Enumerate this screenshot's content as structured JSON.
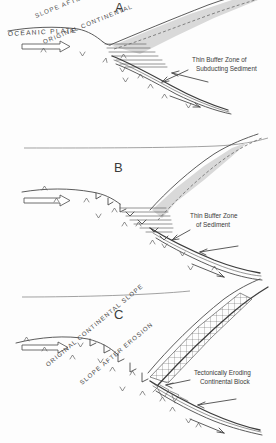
{
  "figure": {
    "style": "hand-drawn line diagram, grayscale"
  },
  "colors": {
    "ink": "#4a4a4a",
    "ink_light": "#6a6a6a",
    "wedge_fill": "#d9d9d9",
    "background": "#ffffff",
    "water_line": "#8a8a8a"
  },
  "panels": [
    {
      "id": "a",
      "letter": "A",
      "labels": {
        "oceanic_plate": "OCEANIC PLATE",
        "slope_after": "SLOPE AFTER ACCRETION",
        "original_slope": "ORIGINAL CONTINENTAL",
        "buffer_line1": "Thin Buffer Zone of",
        "buffer_line2": "Subducting  Sediment"
      }
    },
    {
      "id": "b",
      "letter": "B",
      "labels": {
        "buffer_line1": "Thin Buffer Zone",
        "buffer_line2": "of  Sediment"
      }
    },
    {
      "id": "c",
      "letter": "C",
      "labels": {
        "original_slope": "ORIGINAL CONTINENTAL SLOPE",
        "slope_after": "SLOPE AFTER EROSION",
        "block_line1": "Tectonically Eroding",
        "block_line2": "Continental Block"
      }
    }
  ]
}
